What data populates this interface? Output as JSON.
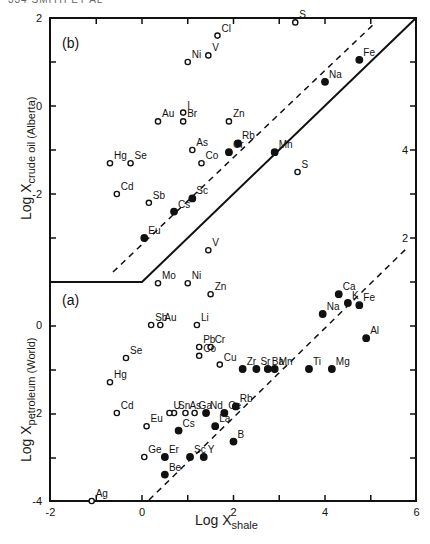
{
  "header": "334   SMITH ET AL",
  "chart_data": [
    {
      "type": "scatter",
      "panel": "(b)",
      "title": "(b)",
      "xlabel": "Log X_shale",
      "ylabel": "Log X_crude oil (Alberta)",
      "xlim": [
        -2,
        6
      ],
      "ylim": [
        -3.9,
        2
      ],
      "yticks": [
        2,
        0,
        -2
      ],
      "right_ticks": [
        4,
        2
      ],
      "legend": {
        "open_circle": "trace element (open)",
        "filled_circle": "element (filled)"
      },
      "lines": {
        "solid": [
          [
            -2,
            -3.9
          ],
          [
            0,
            -3.9
          ],
          [
            6,
            2
          ]
        ],
        "dashed": [
          [
            -0.65,
            -3.75
          ],
          [
            5.1,
            1.9
          ]
        ]
      },
      "points": [
        {
          "el": "Cl",
          "x": 1.65,
          "y": 1.6,
          "filled": false
        },
        {
          "el": "S",
          "x": 3.35,
          "y": 1.9,
          "filled": false
        },
        {
          "el": "V",
          "x": 1.45,
          "y": 1.15,
          "filled": false
        },
        {
          "el": "Ni",
          "x": 1.0,
          "y": 1.0,
          "filled": false
        },
        {
          "el": "Fe",
          "x": 4.75,
          "y": 1.05,
          "filled": true
        },
        {
          "el": "Na",
          "x": 4.0,
          "y": 0.55,
          "filled": true
        },
        {
          "el": "Au",
          "x": 0.35,
          "y": -0.35,
          "filled": false
        },
        {
          "el": "I",
          "x": 0.9,
          "y": -0.15,
          "filled": false
        },
        {
          "el": "Br",
          "x": 0.9,
          "y": -0.35,
          "filled": false
        },
        {
          "el": "Zn",
          "x": 1.9,
          "y": -0.35,
          "filled": false
        },
        {
          "el": "As",
          "x": 1.1,
          "y": -1.0,
          "filled": false
        },
        {
          "el": "Rb",
          "x": 2.1,
          "y": -0.85,
          "filled": true
        },
        {
          "el": "Cr",
          "x": 1.9,
          "y": -1.05,
          "filled": true
        },
        {
          "el": "Mn",
          "x": 2.9,
          "y": -1.05,
          "filled": true
        },
        {
          "el": "Co",
          "x": 1.3,
          "y": -1.3,
          "filled": false
        },
        {
          "el": "Hg",
          "x": -0.7,
          "y": -1.3,
          "filled": false
        },
        {
          "el": "Se",
          "x": -0.25,
          "y": -1.3,
          "filled": false
        },
        {
          "el": "S",
          "x": 3.4,
          "y": -1.5,
          "filled": false
        },
        {
          "el": "Cd",
          "x": -0.55,
          "y": -2.0,
          "filled": false
        },
        {
          "el": "Sb",
          "x": 0.15,
          "y": -2.2,
          "filled": false
        },
        {
          "el": "Sc",
          "x": 1.1,
          "y": -2.1,
          "filled": true
        },
        {
          "el": "Cs",
          "x": 0.7,
          "y": -2.4,
          "filled": true
        },
        {
          "el": "Eu",
          "x": 0.05,
          "y": -3.0,
          "filled": true
        }
      ]
    },
    {
      "type": "scatter",
      "panel": "(a)",
      "title": "(a)",
      "xlabel": "Log X_shale",
      "ylabel": "Log X_petroleum (World)",
      "xlim": [
        -2,
        6
      ],
      "ylim": [
        -4,
        1
      ],
      "xticks": [
        -2,
        0,
        2,
        4,
        6
      ],
      "yticks": [
        0,
        -2,
        -4
      ],
      "lines": {
        "dashed": [
          [
            0.15,
            -4
          ],
          [
            5.8,
            1.8
          ]
        ]
      },
      "points": [
        {
          "el": "V",
          "x": 1.45,
          "y": 1.7,
          "filled": false
        },
        {
          "el": "Mo",
          "x": 0.35,
          "y": 0.95,
          "filled": false
        },
        {
          "el": "Ni",
          "x": 1.0,
          "y": 0.95,
          "filled": false
        },
        {
          "el": "Zn",
          "x": 1.5,
          "y": 0.7,
          "filled": false
        },
        {
          "el": "Ca",
          "x": 4.3,
          "y": 0.7,
          "filled": true
        },
        {
          "el": "K",
          "x": 4.5,
          "y": 0.5,
          "filled": true
        },
        {
          "el": "Fe",
          "x": 4.75,
          "y": 0.45,
          "filled": true
        },
        {
          "el": "Na",
          "x": 3.95,
          "y": 0.25,
          "filled": true
        },
        {
          "el": "Sb",
          "x": 0.2,
          "y": 0.0,
          "filled": false
        },
        {
          "el": "Au",
          "x": 0.4,
          "y": 0.0,
          "filled": false
        },
        {
          "el": "Li",
          "x": 1.2,
          "y": 0.0,
          "filled": false
        },
        {
          "el": "Al",
          "x": 4.9,
          "y": -0.3,
          "filled": true
        },
        {
          "el": "Pb",
          "x": 1.25,
          "y": -0.5,
          "filled": false
        },
        {
          "el": "Cr",
          "x": 1.5,
          "y": -0.5,
          "filled": false
        },
        {
          "el": "Co",
          "x": 1.25,
          "y": -0.7,
          "filled": false
        },
        {
          "el": "Se",
          "x": -0.35,
          "y": -0.75,
          "filled": false
        },
        {
          "el": "Cu",
          "x": 1.7,
          "y": -0.9,
          "filled": false
        },
        {
          "el": "Zr",
          "x": 2.2,
          "y": -1.0,
          "filled": true
        },
        {
          "el": "Sr",
          "x": 2.5,
          "y": -1.0,
          "filled": true
        },
        {
          "el": "Ba",
          "x": 2.75,
          "y": -1.0,
          "filled": true
        },
        {
          "el": "Mn",
          "x": 2.9,
          "y": -1.0,
          "filled": true
        },
        {
          "el": "Ti",
          "x": 3.65,
          "y": -1.0,
          "filled": true
        },
        {
          "el": "Mg",
          "x": 4.15,
          "y": -1.0,
          "filled": true
        },
        {
          "el": "Hg",
          "x": -0.7,
          "y": -1.3,
          "filled": false
        },
        {
          "el": "Rb",
          "x": 2.05,
          "y": -1.85,
          "filled": true
        },
        {
          "el": "Ce",
          "x": 1.8,
          "y": -2.0,
          "filled": true
        },
        {
          "el": "Nd",
          "x": 1.4,
          "y": -2.0,
          "filled": true
        },
        {
          "el": "As",
          "x": 0.95,
          "y": -2.0,
          "filled": false
        },
        {
          "el": "Sn",
          "x": 0.7,
          "y": -2.0,
          "filled": false
        },
        {
          "el": "U",
          "x": 0.6,
          "y": -2.0,
          "filled": false
        },
        {
          "el": "Cd",
          "x": -0.55,
          "y": -2.0,
          "filled": false
        },
        {
          "el": "Ga",
          "x": 1.15,
          "y": -2.0,
          "filled": false
        },
        {
          "el": "Eu",
          "x": 0.1,
          "y": -2.3,
          "filled": false
        },
        {
          "el": "La",
          "x": 1.6,
          "y": -2.3,
          "filled": true
        },
        {
          "el": "Cs",
          "x": 0.8,
          "y": -2.4,
          "filled": true
        },
        {
          "el": "B",
          "x": 2.0,
          "y": -2.65,
          "filled": true
        },
        {
          "el": "Ge",
          "x": 0.05,
          "y": -3.0,
          "filled": false
        },
        {
          "el": "Er",
          "x": 0.5,
          "y": -3.0,
          "filled": true
        },
        {
          "el": "Sc",
          "x": 1.05,
          "y": -3.0,
          "filled": true
        },
        {
          "el": "Y",
          "x": 1.35,
          "y": -3.0,
          "filled": true
        },
        {
          "el": "Be",
          "x": 0.5,
          "y": -3.4,
          "filled": true
        },
        {
          "el": "Ag",
          "x": -1.1,
          "y": -4.0,
          "filled": false
        }
      ]
    }
  ],
  "axes": {
    "left_labels_b": [
      "2",
      "0",
      "-2"
    ],
    "left_labels_a": [
      "0",
      "-2",
      "-4"
    ],
    "right_labels": [
      "4",
      "2"
    ],
    "bottom_labels": [
      "-2",
      "0",
      "2",
      "4",
      "6"
    ],
    "xlabel_main": "Log X",
    "xlabel_sub": "shale",
    "ylabel_b_main": "Log X",
    "ylabel_b_sub": "crude oil (Alberta)",
    "ylabel_a_main": "Log X",
    "ylabel_a_sub": "petroleum (World)",
    "panel_b": "(b)",
    "panel_a": "(a)"
  }
}
